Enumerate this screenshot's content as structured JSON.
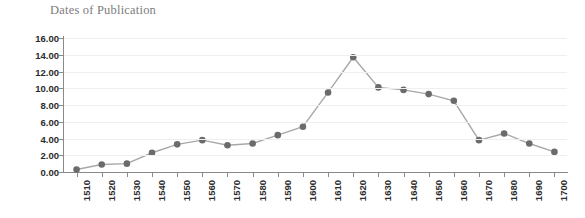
{
  "chart_data": {
    "type": "line",
    "title": "Dates of Publication",
    "xlabel": "",
    "ylabel": "",
    "categories": [
      "1510",
      "1520",
      "1530",
      "1540",
      "1550",
      "1560",
      "1570",
      "1580",
      "1590",
      "1600",
      "1610",
      "1620",
      "1630",
      "1640",
      "1650",
      "1660",
      "1670",
      "1680",
      "1690",
      "1700"
    ],
    "values": [
      0.3,
      0.9,
      1.0,
      2.3,
      3.3,
      3.8,
      3.2,
      3.4,
      4.4,
      5.4,
      9.5,
      13.7,
      10.1,
      9.8,
      9.3,
      8.5,
      3.8,
      4.6,
      3.4,
      2.4
    ],
    "series": [
      {
        "name": "Dates of Publication",
        "values": [
          0.3,
          0.9,
          1.0,
          2.3,
          3.3,
          3.8,
          3.2,
          3.4,
          4.4,
          5.4,
          9.5,
          13.7,
          10.1,
          9.8,
          9.3,
          8.5,
          3.8,
          4.6,
          3.4,
          2.4
        ]
      }
    ],
    "ylim": [
      0,
      16
    ],
    "ytick_values": [
      0,
      2,
      4,
      6,
      8,
      10,
      12,
      14,
      16
    ],
    "ytick_labels": [
      "0.00",
      "2.00",
      "4.00",
      "6.00",
      "8.00",
      "10.00",
      "12.00",
      "14.00",
      "16.00"
    ],
    "ytick_step": 2,
    "grid": true,
    "grid_axis": "y",
    "legend": false,
    "legend_position": "none",
    "marker": "circle",
    "xtick_label_rotation": -90,
    "colors": {
      "line": "#a8a8a8",
      "marker": "#6b6b6b",
      "gridline": "#efefef",
      "axis": "#8a8a8a",
      "tick_label": "#2b2b2b",
      "title": "#7c7c7c",
      "background": "#ffffff"
    }
  }
}
